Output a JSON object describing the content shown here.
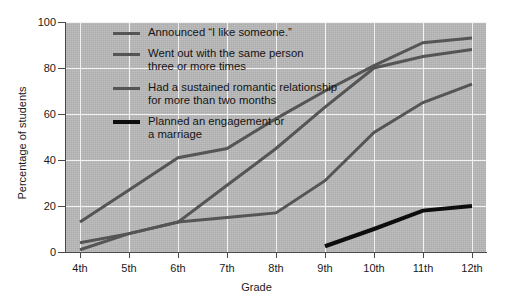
{
  "chart_data": {
    "type": "line",
    "title": "",
    "xlabel": "Grade",
    "ylabel": "Percentage of students",
    "categories": [
      "4th",
      "5th",
      "6th",
      "7th",
      "8th",
      "9th",
      "10th",
      "11th",
      "12th"
    ],
    "xlim": [
      0,
      8
    ],
    "ylim": [
      0,
      100
    ],
    "yticks": [
      0,
      20,
      40,
      60,
      80,
      100
    ],
    "grid": true,
    "legend_position": "upper-left-inside",
    "series": [
      {
        "name": "Announced \"I like someone.\"",
        "color": "#555555",
        "width": 3,
        "values": [
          13,
          27,
          41,
          45,
          58,
          70,
          81,
          91,
          93
        ]
      },
      {
        "name": "Went out with the same person three or more times",
        "color": "#555555",
        "width": 3,
        "values": [
          4,
          8,
          13,
          29,
          45,
          63,
          80,
          85,
          88
        ]
      },
      {
        "name": "Had a sustained romantic relationship for more than two months",
        "color": "#555555",
        "width": 3,
        "values": [
          1,
          8,
          13,
          15,
          17,
          31,
          52,
          65,
          73
        ]
      },
      {
        "name": "Planned an engagement or a marriage",
        "color": "#0d0d0d",
        "width": 4,
        "start_index": 5,
        "values": [
          null,
          null,
          null,
          null,
          null,
          2.5,
          10,
          18,
          20
        ]
      }
    ]
  },
  "legend": {
    "items": [
      {
        "label": "Announced “I like someone.”",
        "swatch": "#555555",
        "thick": false
      },
      {
        "label": "Went out with the same person\nthree or more times",
        "swatch": "#555555",
        "thick": false
      },
      {
        "label": "Had a sustained romantic relationship\nfor more than two months",
        "swatch": "#555555",
        "thick": false
      },
      {
        "label": "Planned an engagement or\na marriage",
        "swatch": "#0d0d0d",
        "thick": true
      }
    ]
  },
  "axes": {
    "y_title": "Percentage of students",
    "x_title": "Grade",
    "y_tick_labels": [
      "100",
      "80",
      "60",
      "40",
      "20",
      "0"
    ],
    "x_tick_labels": [
      "4th",
      "5th",
      "6th",
      "7th",
      "8th",
      "9th",
      "10th",
      "11th",
      "12th"
    ]
  },
  "style": {
    "plot_background": "#b9b9b9",
    "gridline_color": "#f2f2f2",
    "axis_color": "#4a4a4a",
    "text_color": "#1a1a1a"
  }
}
